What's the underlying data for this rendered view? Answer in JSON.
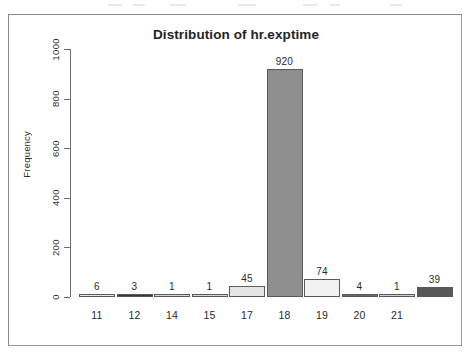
{
  "chart_data": {
    "type": "bar",
    "title": "Distribution of hr.exptime",
    "xlabel": "",
    "ylabel": "Frequency",
    "categories": [
      "11",
      "12",
      "14",
      "15",
      "17",
      "18",
      "19",
      "20",
      "21",
      ""
    ],
    "values": [
      6,
      3,
      1,
      1,
      45,
      920,
      74,
      4,
      1,
      39
    ],
    "bar_labels": [
      "6",
      "3",
      "1",
      "1",
      "45",
      "920",
      "74",
      "4",
      "1",
      "39"
    ],
    "bar_colors": [
      "#e8e8e8",
      "#3a3a3a",
      "#d8d8d8",
      "#d8d8d8",
      "#e4e4e4",
      "#8f8f8f",
      "#f2f2f2",
      "#6a6a6a",
      "#d0d0d0",
      "#585858"
    ],
    "ylim": [
      0,
      1000
    ],
    "yticks": [
      "0",
      "200",
      "400",
      "600",
      "800",
      "1000"
    ],
    "ytick_values": [
      0,
      200,
      400,
      600,
      800,
      1000
    ],
    "grid": false,
    "legend": false
  },
  "frame": {
    "border_color": "#8a8a8a",
    "background": "#ffffff"
  }
}
